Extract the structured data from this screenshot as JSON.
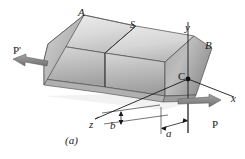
{
  "figure": {
    "caption": "(a)",
    "colors": {
      "outline": "#1a1a1a",
      "label_text": "#1a1a1a",
      "background": "#ffffff",
      "face_top_light": "#e4e4e4",
      "face_top_dark": "#bdbdbd",
      "face_front_light": "#d3d3d3",
      "face_front_dark": "#9c9c9c",
      "face_end_light": "#c9c9c9",
      "face_end_dark": "#8f8f8f",
      "arrow_fill": "#8a8a8a",
      "shadow": "#ededed"
    },
    "labels": {
      "A": "A",
      "S": "S",
      "B": "B",
      "C": "C",
      "axis_x": "x",
      "axis_y": "y",
      "axis_z": "z",
      "dim_a": "a",
      "dim_b": "b",
      "force_P": "P",
      "force_P_prime": "P'"
    }
  }
}
